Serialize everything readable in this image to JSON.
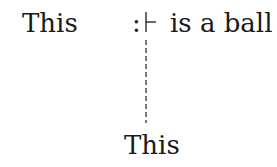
{
  "diagram": {
    "subject_word": "This",
    "colon": ":",
    "predicate": "is a ball",
    "lower_word": "This",
    "turnstile_symbol": "⊢",
    "connector_style": "dashed"
  }
}
